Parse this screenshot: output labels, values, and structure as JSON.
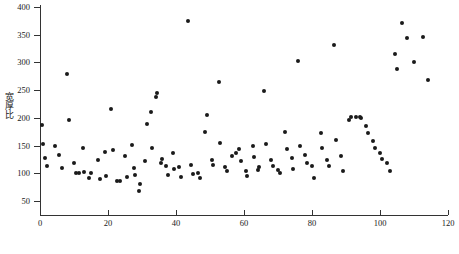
{
  "chart_data": {
    "type": "scatter",
    "title": "",
    "xlabel": "",
    "ylabel": "宽厚比",
    "xlim": [
      0,
      120
    ],
    "ylim": [
      25,
      400
    ],
    "grid": false,
    "legend": null,
    "xticks": [
      0,
      20,
      40,
      60,
      80,
      100,
      120
    ],
    "yticks": [
      50,
      100,
      150,
      200,
      250,
      300,
      350,
      400
    ],
    "xtick_labels": [
      "0",
      "20",
      "40",
      "60",
      "80",
      "100",
      "120"
    ],
    "ytick_labels": [
      "50",
      "100",
      "150",
      "200",
      "250",
      "300",
      "350",
      "400"
    ],
    "marker": "circle",
    "marker_color": "#1a1a1a",
    "marker_size": 4,
    "n_points": 104,
    "points": [
      [
        0.5,
        187
      ],
      [
        1.0,
        153
      ],
      [
        1.5,
        127
      ],
      [
        2.0,
        113
      ],
      [
        4.5,
        150
      ],
      [
        5.5,
        133
      ],
      [
        6.5,
        110
      ],
      [
        8.0,
        279
      ],
      [
        8.5,
        196
      ],
      [
        10.0,
        118
      ],
      [
        10.5,
        100
      ],
      [
        11.5,
        100
      ],
      [
        12.5,
        145
      ],
      [
        13.0,
        103
      ],
      [
        14.5,
        92
      ],
      [
        15.0,
        101
      ],
      [
        17.0,
        124
      ],
      [
        17.5,
        90
      ],
      [
        19.0,
        138
      ],
      [
        19.5,
        96
      ],
      [
        21.0,
        216
      ],
      [
        21.5,
        142
      ],
      [
        22.5,
        86
      ],
      [
        23.5,
        86
      ],
      [
        25.0,
        131
      ],
      [
        25.5,
        93
      ],
      [
        27.0,
        152
      ],
      [
        27.5,
        110
      ],
      [
        28.0,
        97
      ],
      [
        29.0,
        69
      ],
      [
        29.5,
        80
      ],
      [
        31.0,
        123
      ],
      [
        31.5,
        189
      ],
      [
        32.5,
        211
      ],
      [
        33.0,
        145
      ],
      [
        34.0,
        238
      ],
      [
        34.5,
        245
      ],
      [
        35.5,
        118
      ],
      [
        36.0,
        126
      ],
      [
        37.0,
        113
      ],
      [
        37.5,
        97
      ],
      [
        39.0,
        137
      ],
      [
        39.5,
        108
      ],
      [
        41.0,
        111
      ],
      [
        41.5,
        93
      ],
      [
        43.5,
        375
      ],
      [
        44.5,
        115
      ],
      [
        45.0,
        99
      ],
      [
        46.5,
        101
      ],
      [
        47.0,
        92
      ],
      [
        48.5,
        174
      ],
      [
        49.0,
        205
      ],
      [
        50.5,
        125
      ],
      [
        51.0,
        116
      ],
      [
        52.5,
        265
      ],
      [
        53.0,
        155
      ],
      [
        54.5,
        111
      ],
      [
        55.0,
        104
      ],
      [
        56.5,
        131
      ],
      [
        57.5,
        136
      ],
      [
        58.5,
        144
      ],
      [
        59.0,
        122
      ],
      [
        60.5,
        104
      ],
      [
        61.0,
        96
      ],
      [
        62.5,
        149
      ],
      [
        63.0,
        129
      ],
      [
        64.0,
        106
      ],
      [
        64.5,
        112
      ],
      [
        66.0,
        249
      ],
      [
        66.5,
        153
      ],
      [
        68.0,
        125
      ],
      [
        68.5,
        114
      ],
      [
        70.0,
        106
      ],
      [
        70.5,
        100
      ],
      [
        72.0,
        175
      ],
      [
        72.5,
        144
      ],
      [
        74.0,
        128
      ],
      [
        74.5,
        108
      ],
      [
        76.0,
        302
      ],
      [
        76.5,
        150
      ],
      [
        78.0,
        133
      ],
      [
        78.5,
        118
      ],
      [
        80.0,
        113
      ],
      [
        80.5,
        91
      ],
      [
        82.5,
        172
      ],
      [
        83.0,
        145
      ],
      [
        84.5,
        125
      ],
      [
        85.0,
        114
      ],
      [
        86.5,
        331
      ],
      [
        87.0,
        160
      ],
      [
        88.5,
        131
      ],
      [
        89.0,
        104
      ],
      [
        91.0,
        196
      ],
      [
        91.5,
        202
      ],
      [
        93.0,
        202
      ],
      [
        94.0,
        202
      ],
      [
        94.5,
        199
      ],
      [
        96.0,
        185
      ],
      [
        96.5,
        172
      ],
      [
        98.0,
        159
      ],
      [
        98.5,
        146
      ],
      [
        100.0,
        137
      ],
      [
        100.5,
        126
      ],
      [
        102.0,
        118
      ],
      [
        103.0,
        104
      ],
      [
        104.5,
        316
      ],
      [
        105.0,
        289
      ],
      [
        106.5,
        371
      ],
      [
        108.0,
        344
      ],
      [
        110.0,
        300
      ],
      [
        112.5,
        346
      ],
      [
        114.0,
        268
      ]
    ]
  },
  "caption": {
    "text": ""
  }
}
